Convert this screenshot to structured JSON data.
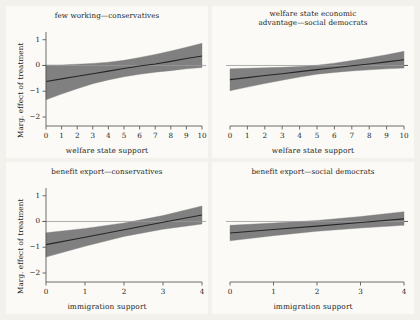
{
  "figure": {
    "background_color": "#f3f1ec",
    "panel_color": "#fbfaf7",
    "band_color": "#808080",
    "line_color": "#262626",
    "axis_color": "#4a4a4a",
    "zero_line_color": "#9a9a9a"
  },
  "chart_data": [
    {
      "type": "line",
      "panel": "top-left",
      "title": "few working—conservatives",
      "xlabel": "welfare state support",
      "ylabel": "Marg. effect of treatment",
      "xlim": [
        0,
        10
      ],
      "ylim": [
        -2.35,
        1.3
      ],
      "xticks": [
        0,
        1,
        2,
        3,
        4,
        5,
        6,
        7,
        8,
        9,
        10
      ],
      "xticklabels": [
        "0",
        "1",
        "2",
        "3",
        "4",
        "5",
        "6",
        "7",
        "8",
        "9",
        "10"
      ],
      "yticks": [
        1,
        0,
        -1,
        -2
      ],
      "yticklabels": [
        "1",
        "0",
        "−1",
        "−2"
      ],
      "grid": false,
      "legend": "none",
      "zero_reference_line": 0,
      "series": [
        {
          "name": "marginal effect",
          "x": [
            0,
            1,
            2,
            3,
            4,
            5,
            6,
            7,
            8,
            9,
            10
          ],
          "values": [
            -0.62,
            -0.52,
            -0.42,
            -0.32,
            -0.22,
            -0.12,
            -0.02,
            0.06,
            0.16,
            0.27,
            0.37
          ]
        },
        {
          "name": "95% CI upper",
          "x": [
            0,
            1,
            2,
            3,
            4,
            5,
            6,
            7,
            8,
            9,
            10
          ],
          "values": [
            0.02,
            0.02,
            0.05,
            0.08,
            0.13,
            0.2,
            0.31,
            0.43,
            0.56,
            0.71,
            0.86
          ]
        },
        {
          "name": "95% CI lower",
          "x": [
            0,
            1,
            2,
            3,
            4,
            5,
            6,
            7,
            8,
            9,
            10
          ],
          "values": [
            -1.33,
            -1.11,
            -0.9,
            -0.71,
            -0.56,
            -0.44,
            -0.34,
            -0.26,
            -0.2,
            -0.13,
            -0.08
          ]
        }
      ]
    },
    {
      "type": "line",
      "panel": "top-right",
      "title": "welfare state economic",
      "title_line2": "advantage—social democrats",
      "xlabel": "welfare state support",
      "ylabel": "",
      "xlim": [
        0,
        10
      ],
      "ylim": [
        -2.35,
        1.3
      ],
      "xticks": [
        0,
        1,
        2,
        3,
        4,
        5,
        6,
        7,
        8,
        9,
        10
      ],
      "xticklabels": [
        "0",
        "1",
        "2",
        "3",
        "4",
        "5",
        "6",
        "7",
        "8",
        "9",
        "10"
      ],
      "yticks": [
        1,
        0,
        -1,
        -2
      ],
      "yticklabels": [
        "1",
        "0",
        "−1",
        "−2"
      ],
      "grid": false,
      "legend": "none",
      "zero_reference_line": 0,
      "series": [
        {
          "name": "marginal effect",
          "x": [
            0,
            1,
            2,
            3,
            4,
            5,
            6,
            7,
            8,
            9,
            10
          ],
          "values": [
            -0.55,
            -0.47,
            -0.39,
            -0.32,
            -0.24,
            -0.16,
            -0.09,
            -0.01,
            0.06,
            0.14,
            0.22
          ]
        },
        {
          "name": "95% CI upper",
          "x": [
            0,
            1,
            2,
            3,
            4,
            5,
            6,
            7,
            8,
            9,
            10
          ],
          "values": [
            -0.13,
            -0.11,
            -0.09,
            -0.07,
            -0.04,
            0.01,
            0.09,
            0.19,
            0.3,
            0.42,
            0.55
          ]
        },
        {
          "name": "95% CI lower",
          "x": [
            0,
            1,
            2,
            3,
            4,
            5,
            6,
            7,
            8,
            9,
            10
          ],
          "values": [
            -0.98,
            -0.84,
            -0.7,
            -0.57,
            -0.45,
            -0.34,
            -0.27,
            -0.21,
            -0.17,
            -0.13,
            -0.1
          ]
        }
      ]
    },
    {
      "type": "line",
      "panel": "bottom-left",
      "title": "benefit export—conservatives",
      "xlabel": "immigration support",
      "ylabel": "Marg. effect of treatment",
      "xlim": [
        0,
        4
      ],
      "ylim": [
        -2.35,
        1.3
      ],
      "xticks": [
        0,
        1,
        2,
        3,
        4
      ],
      "xticklabels": [
        "0",
        "1",
        "2",
        "3",
        "4"
      ],
      "yticks": [
        1,
        0,
        -1,
        -2
      ],
      "yticklabels": [
        "1",
        "0",
        "−1",
        "−2"
      ],
      "grid": false,
      "legend": "none",
      "zero_reference_line": 0,
      "series": [
        {
          "name": "marginal effect",
          "x": [
            0,
            1,
            2,
            3,
            4
          ],
          "values": [
            -0.9,
            -0.61,
            -0.32,
            -0.03,
            0.25
          ]
        },
        {
          "name": "95% CI upper",
          "x": [
            0,
            1,
            2,
            3,
            4
          ],
          "values": [
            -0.44,
            -0.27,
            -0.06,
            0.23,
            0.6
          ]
        },
        {
          "name": "95% CI lower",
          "x": [
            0,
            1,
            2,
            3,
            4
          ],
          "values": [
            -1.38,
            -0.96,
            -0.58,
            -0.3,
            -0.1
          ]
        }
      ]
    },
    {
      "type": "line",
      "panel": "bottom-right",
      "title": "benefit export—social democrats",
      "xlabel": "immigration support",
      "ylabel": "",
      "xlim": [
        0,
        4
      ],
      "ylim": [
        -2.35,
        1.3
      ],
      "xticks": [
        0,
        1,
        2,
        3,
        4
      ],
      "xticklabels": [
        "0",
        "1",
        "2",
        "3",
        "4"
      ],
      "yticks": [
        1,
        0,
        -1,
        -2
      ],
      "yticklabels": [
        "1",
        "0",
        "−1",
        "−2"
      ],
      "grid": false,
      "legend": "none",
      "zero_reference_line": 0,
      "series": [
        {
          "name": "marginal effect",
          "x": [
            0,
            1,
            2,
            3,
            4
          ],
          "values": [
            -0.45,
            -0.31,
            -0.18,
            -0.04,
            0.1
          ]
        },
        {
          "name": "95% CI upper",
          "x": [
            0,
            1,
            2,
            3,
            4
          ],
          "values": [
            -0.15,
            -0.06,
            0.04,
            0.19,
            0.38
          ]
        },
        {
          "name": "95% CI lower",
          "x": [
            0,
            1,
            2,
            3,
            4
          ],
          "values": [
            -0.75,
            -0.55,
            -0.38,
            -0.25,
            -0.15
          ]
        }
      ]
    }
  ]
}
